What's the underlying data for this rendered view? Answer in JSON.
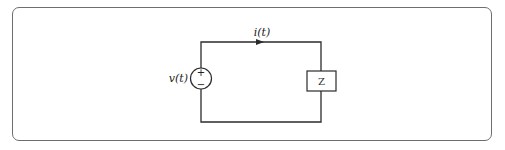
{
  "diagram": {
    "type": "circuit",
    "source": {
      "label": "v(t)",
      "plus": "+",
      "minus": "−"
    },
    "current": {
      "label": "i(t)",
      "direction": "clockwise"
    },
    "load": {
      "label": "Z"
    },
    "colors": {
      "wire": "#2b2b2b",
      "frame": "#6e6e6e"
    }
  }
}
